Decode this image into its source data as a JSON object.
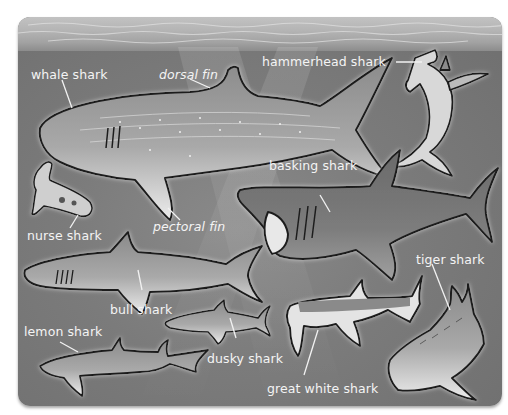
{
  "diagram": {
    "labels": {
      "whale_shark": "whale shark",
      "dorsal_fin": "dorsal fin",
      "pectoral_fin": "pectoral fin",
      "hammerhead_shark": "hammerhead shark",
      "basking_shark": "basking shark",
      "nurse_shark": "nurse shark",
      "bull_shark": "bull shark",
      "tiger_shark": "tiger shark",
      "lemon_shark": "lemon shark",
      "dusky_shark": "dusky shark",
      "great_white_shark": "great white shark"
    },
    "colors": {
      "water": "#7b7b7b",
      "surface": "#b8b8b8",
      "label_text": "#f4f4f4",
      "outline": "#1e1e1e",
      "shark_body": "#9a9a9a",
      "shark_belly": "#e8e8e8"
    }
  }
}
